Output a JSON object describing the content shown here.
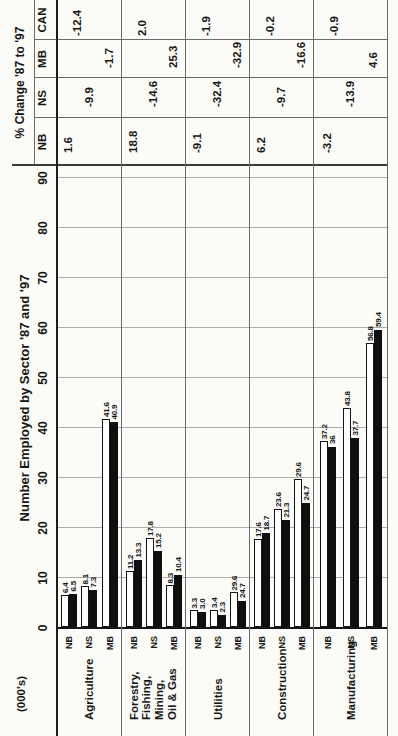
{
  "chart_data": {
    "type": "bar",
    "orientation": "horizontal grouped bars; whole page printed rotated 90° counter-clockwise",
    "title": "Number Employed by Sector '87 and '97",
    "units_label": "(000's)",
    "series": [
      {
        "name": "'87",
        "fill": "#ffffff"
      },
      {
        "name": "'97",
        "fill": "#0f0f0f"
      }
    ],
    "axis": {
      "min": 0,
      "max": 90,
      "ticks": [
        0,
        10,
        20,
        30,
        40,
        50,
        60,
        70,
        80,
        90
      ],
      "grid": true
    },
    "pct_table": {
      "title": "% Change '87 to '97",
      "columns": [
        "NB",
        "NS",
        "MB",
        "CAN"
      ]
    },
    "sectors": [
      {
        "name_lines": [
          "Agriculture"
        ],
        "groups": [
          {
            "province": "NB",
            "label87": "6.4",
            "label97": "6.5",
            "len87": 6.4,
            "len97": 6.5
          },
          {
            "province": "NS",
            "label87": "8.1",
            "label97": "7.3",
            "len87": 8.1,
            "len97": 7.3
          },
          {
            "province": "MB",
            "label87": "41.6",
            "label97": "40.9",
            "len87": 41.6,
            "len97": 40.9
          }
        ],
        "pct": {
          "NB": "1.6",
          "NS": "-9.9",
          "MB": "-1.7",
          "CAN": "-12.4"
        }
      },
      {
        "name_lines": [
          "Forestry,",
          "Fishing, Mining,",
          "Oil & Gas"
        ],
        "groups": [
          {
            "province": "NB",
            "label87": "11.2",
            "label97": "13.3",
            "len87": 11.2,
            "len97": 13.3
          },
          {
            "province": "NS",
            "label87": "17.8",
            "label97": "15.2",
            "len87": 17.8,
            "len97": 15.2
          },
          {
            "province": "MB",
            "label87": "8.3",
            "label97": "10.4",
            "len87": 8.3,
            "len97": 10.4
          }
        ],
        "pct": {
          "NB": "18.8",
          "NS": "-14.6",
          "MB": "25.3",
          "CAN": "2.0"
        }
      },
      {
        "name_lines": [
          "Utilities"
        ],
        "groups": [
          {
            "province": "NB",
            "label87": "3.3",
            "label97": "3.0",
            "len87": 3.3,
            "len97": 3.0
          },
          {
            "province": "NS",
            "label87": "3.4",
            "label97": "2.3",
            "len87": 3.4,
            "len97": 2.3
          },
          {
            "province": "MB",
            "label87": "29.6",
            "label97": "24.7",
            "len87": 6.9,
            "len97": 5.2
          }
        ],
        "pct": {
          "NB": "-9.1",
          "NS": "-32.4",
          "MB": "-32.9",
          "CAN": "-1.9"
        }
      },
      {
        "name_lines": [
          "Construction"
        ],
        "groups": [
          {
            "province": "NB",
            "label87": "17.6",
            "label97": "18.7",
            "len87": 17.6,
            "len97": 18.7
          },
          {
            "province": "NS",
            "label87": "23.6",
            "label97": "21.3",
            "len87": 23.6,
            "len97": 21.3
          },
          {
            "province": "MB",
            "label87": "29.6",
            "label97": "24.7",
            "len87": 29.6,
            "len97": 24.7
          }
        ],
        "pct": {
          "NB": "6.2",
          "NS": "-9.7",
          "MB": "-16.6",
          "CAN": "-0.2"
        }
      },
      {
        "name_lines": [
          "Manufacturing"
        ],
        "groups": [
          {
            "province": "NB",
            "label87": "37.2",
            "label97": "36",
            "len87": 37.2,
            "len97": 36
          },
          {
            "province": "NS",
            "label87": "43.8",
            "label97": "37.7",
            "len87": 43.8,
            "len97": 37.7
          },
          {
            "province": "MB",
            "label87": "56.8",
            "label97": "59.4",
            "len87": 56.8,
            "len97": 59.4
          }
        ],
        "pct": {
          "NB": "-3.2",
          "NS": "-13.9",
          "MB": "4.6",
          "CAN": "-0.9"
        }
      }
    ],
    "colors": {
      "text": "#161616",
      "gridline": "#adadad",
      "rule": "#6b6b6b",
      "bar_87": "#ffffff",
      "bar_97": "#0f0f0f"
    }
  }
}
